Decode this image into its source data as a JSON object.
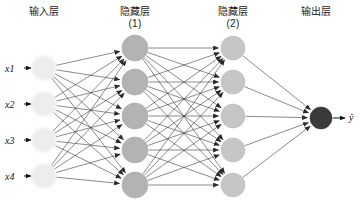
{
  "diagram": {
    "title_layers": [
      {
        "name": "input-layer-title",
        "text": "输入层",
        "cx": 44,
        "top": 6
      },
      {
        "name": "hidden-layer-1-title",
        "text": "隐藏层\n(1)",
        "cx": 135,
        "top": 6
      },
      {
        "name": "hidden-layer-2-title",
        "text": "隐藏层\n(2)",
        "cx": 233,
        "top": 6
      },
      {
        "name": "output-layer-title",
        "text": "输出层",
        "cx": 316,
        "top": 6
      }
    ],
    "input_labels": [
      {
        "text": "x1",
        "x": 5,
        "y": 63
      },
      {
        "text": "x2",
        "x": 5,
        "y": 99
      },
      {
        "text": "x3",
        "x": 5,
        "y": 135
      },
      {
        "text": "x4",
        "x": 5,
        "y": 171
      }
    ],
    "output_label": {
      "text": "ŷ",
      "x": 349,
      "y": 112
    },
    "layers": [
      {
        "name": "input-layer",
        "fill": "#ededed",
        "stroke": "#e2e2e2",
        "radius": 12,
        "blur": 1.6,
        "cx": 44,
        "nodes_y": [
          68,
          104,
          140,
          176
        ]
      },
      {
        "name": "hidden-layer-1",
        "fill": "#b3b3b3",
        "stroke": "#a8a8a8",
        "radius": 13,
        "blur": 0,
        "cx": 135,
        "nodes_y": [
          48,
          82,
          116,
          150,
          185
        ]
      },
      {
        "name": "hidden-layer-2",
        "fill": "#c6c6c6",
        "stroke": "#bcbcbc",
        "radius": 12,
        "blur": 0,
        "cx": 233,
        "nodes_y": [
          48,
          82,
          116,
          150,
          185
        ]
      },
      {
        "name": "output-layer",
        "fill": "#3a3a3a",
        "stroke": "#303030",
        "radius": 11,
        "blur": 0,
        "cx": 321,
        "nodes_y": [
          118
        ]
      }
    ],
    "edge_color": "#2b2b2b",
    "edge_width": 0.55,
    "input_arrows": [
      {
        "x1": 24,
        "y": 68,
        "x2": 31
      },
      {
        "x1": 24,
        "y": 104,
        "x2": 31
      },
      {
        "x1": 24,
        "y": 140,
        "x2": 31
      },
      {
        "x1": 24,
        "y": 176,
        "x2": 31
      }
    ],
    "output_arrow": {
      "x1": 333,
      "y": 118,
      "x2": 345
    },
    "connections": [
      {
        "from": "input-layer",
        "to": "hidden-layer-1"
      },
      {
        "from": "hidden-layer-1",
        "to": "hidden-layer-2"
      },
      {
        "from": "hidden-layer-2",
        "to": "output-layer"
      }
    ]
  }
}
